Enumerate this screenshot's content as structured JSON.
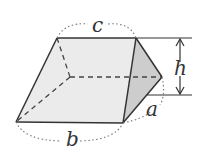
{
  "diagram": {
    "type": "prism",
    "labels": {
      "a": "a",
      "b": "b",
      "c": "c",
      "h": "h"
    },
    "colors": {
      "face": "#e9e9e9",
      "side_face": "#cfcfcf",
      "edge": "#333333",
      "dotted": "#666666"
    }
  }
}
